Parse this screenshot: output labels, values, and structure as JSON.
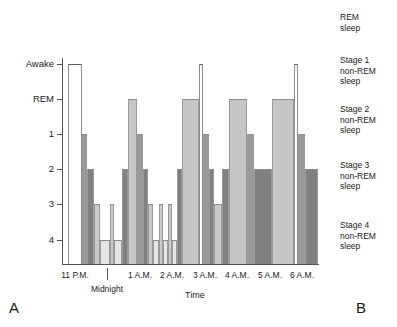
{
  "panels": {
    "left_letter": "A",
    "right_letter": "B"
  },
  "axes": {
    "x_title": "Time",
    "y_ticks": [
      {
        "label": "Awake",
        "y": 64
      },
      {
        "label": "REM",
        "y": 99
      },
      {
        "label": "1",
        "y": 134
      },
      {
        "label": "2",
        "y": 169
      },
      {
        "label": "3",
        "y": 204
      },
      {
        "label": "4",
        "y": 240
      }
    ],
    "x_ticks": [
      {
        "label": "11 P.M.",
        "x": 75,
        "row": 1
      },
      {
        "label": "Midnight",
        "x": 107,
        "row": 2
      },
      {
        "label": "1 A.M.",
        "x": 140,
        "row": 1
      },
      {
        "label": "2 A.M.",
        "x": 172,
        "row": 1
      },
      {
        "label": "3 A.M.",
        "x": 205,
        "row": 1
      },
      {
        "label": "4 A.M.",
        "x": 237,
        "row": 1
      },
      {
        "label": "5 A.M.",
        "x": 270,
        "row": 1
      },
      {
        "label": "6 A.M.",
        "x": 302,
        "row": 1
      }
    ]
  },
  "legend": [
    {
      "name": "rem-sleep",
      "label": "REM\nsleep",
      "top": 12,
      "color": "#c6c6c6"
    },
    {
      "name": "stage-1",
      "label": "Stage 1\nnon-REM\nsleep",
      "top": 55,
      "color": "#9a9a9a"
    },
    {
      "name": "stage-2",
      "label": "Stage 2\nnon-REM\nsleep",
      "top": 104,
      "color": "#808080"
    },
    {
      "name": "stage-3",
      "label": "Stage 3\nnon-REM\nsleep",
      "top": 160,
      "color": "#c9c9c9"
    },
    {
      "name": "stage-4",
      "label": "Stage 4\nnon-REM\nsleep",
      "top": 220,
      "color": "#e6e6e6"
    }
  ],
  "chart_data": {
    "type": "bar",
    "title": "",
    "subtitle": "",
    "xlabel": "Time",
    "ylabel": "",
    "grid": false,
    "legend_position": "right",
    "y_categories": [
      "Awake",
      "REM",
      "1",
      "2",
      "3",
      "4"
    ],
    "y_category_values": {
      "Awake": 0,
      "REM": 1,
      "1": 2,
      "2": 3,
      "3": 4,
      "4": 5
    },
    "x_range": [
      "11 P.M.",
      "6:30 A.M."
    ],
    "x_tick_labels": [
      "11 P.M.",
      "Midnight",
      "1 A.M.",
      "2 A.M.",
      "3 A.M.",
      "4 A.M.",
      "5 A.M.",
      "6 A.M."
    ],
    "annotation": "Hypnogram of sleep stages across one night",
    "bars": [
      {
        "stage": "Awake",
        "x": 68,
        "w": 14,
        "start": "11:08 P.M.",
        "end": "11:34 P.M."
      },
      {
        "stage": "1",
        "x": 82,
        "w": 5,
        "start": "11:34 P.M.",
        "end": "11:43 P.M."
      },
      {
        "stage": "2",
        "x": 87,
        "w": 7,
        "start": "11:43 P.M.",
        "end": "11:56 P.M."
      },
      {
        "stage": "3",
        "x": 94,
        "w": 6,
        "start": "11:56 P.M.",
        "end": "12:07 A.M."
      },
      {
        "stage": "4",
        "x": 100,
        "w": 10,
        "start": "12:07 A.M.",
        "end": "12:26 A.M."
      },
      {
        "stage": "3",
        "x": 110,
        "w": 4,
        "start": "12:26 A.M.",
        "end": "12:34 A.M."
      },
      {
        "stage": "4",
        "x": 114,
        "w": 8,
        "start": "12:34 A.M.",
        "end": "12:49 A.M."
      },
      {
        "stage": "2",
        "x": 122,
        "w": 6,
        "start": "12:49 A.M.",
        "end": "1:00 A.M."
      },
      {
        "stage": "REM",
        "x": 128,
        "w": 9,
        "start": "1:00 A.M.",
        "end": "1:17 A.M."
      },
      {
        "stage": "1",
        "x": 137,
        "w": 6,
        "start": "1:17 A.M.",
        "end": "1:28 A.M."
      },
      {
        "stage": "2",
        "x": 143,
        "w": 5,
        "start": "1:28 A.M.",
        "end": "1:37 A.M."
      },
      {
        "stage": "3",
        "x": 148,
        "w": 5,
        "start": "1:37 A.M.",
        "end": "1:46 A.M."
      },
      {
        "stage": "4",
        "x": 153,
        "w": 6,
        "start": "1:46 A.M.",
        "end": "1:58 A.M."
      },
      {
        "stage": "3",
        "x": 159,
        "w": 4,
        "start": "1:58 A.M.",
        "end": "2:05 A.M."
      },
      {
        "stage": "4",
        "x": 163,
        "w": 5,
        "start": "2:05 A.M.",
        "end": "2:15 A.M."
      },
      {
        "stage": "3",
        "x": 168,
        "w": 4,
        "start": "2:15 A.M.",
        "end": "2:22 A.M."
      },
      {
        "stage": "4",
        "x": 172,
        "w": 5,
        "start": "2:22 A.M.",
        "end": "2:32 A.M."
      },
      {
        "stage": "2",
        "x": 177,
        "w": 5,
        "start": "2:32 A.M.",
        "end": "2:41 A.M."
      },
      {
        "stage": "REM",
        "x": 182,
        "w": 17,
        "start": "2:41 A.M.",
        "end": "3:14 A.M."
      },
      {
        "stage": "Awake",
        "x": 199,
        "w": 4,
        "start": "3:14 A.M.",
        "end": "3:21 A.M."
      },
      {
        "stage": "1",
        "x": 203,
        "w": 6,
        "start": "3:21 A.M.",
        "end": "3:32 A.M."
      },
      {
        "stage": "2",
        "x": 209,
        "w": 5,
        "start": "3:32 A.M.",
        "end": "3:41 A.M."
      },
      {
        "stage": "3",
        "x": 214,
        "w": 8,
        "start": "3:41 A.M.",
        "end": "3:57 A.M."
      },
      {
        "stage": "2",
        "x": 222,
        "w": 7,
        "start": "3:57 A.M.",
        "end": "4:10 A.M."
      },
      {
        "stage": "REM",
        "x": 229,
        "w": 18,
        "start": "4:10 A.M.",
        "end": "4:45 A.M."
      },
      {
        "stage": "1",
        "x": 247,
        "w": 7,
        "start": "4:45 A.M.",
        "end": "4:58 A.M."
      },
      {
        "stage": "2",
        "x": 254,
        "w": 18,
        "start": "4:58 A.M.",
        "end": "5:33 A.M."
      },
      {
        "stage": "REM",
        "x": 272,
        "w": 22,
        "start": "5:33 A.M.",
        "end": "6:15 A.M."
      },
      {
        "stage": "Awake",
        "x": 294,
        "w": 4,
        "start": "6:15 A.M.",
        "end": "6:22 A.M."
      },
      {
        "stage": "1",
        "x": 298,
        "w": 7,
        "start": "6:22 A.M.",
        "end": "6:35 A.M."
      },
      {
        "stage": "2",
        "x": 305,
        "w": 13,
        "start": "6:35 A.M.",
        "end": "7:00 A.M."
      }
    ],
    "stage_colors": {
      "Awake": "#ffffff",
      "REM": "#c6c6c6",
      "1": "#9a9a9a",
      "2": "#808080",
      "3": "#c9c9c9",
      "4": "#e6e6e6"
    }
  }
}
